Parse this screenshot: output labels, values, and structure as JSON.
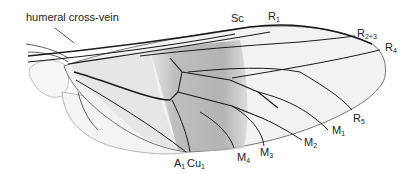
{
  "figure": {
    "labels": {
      "humeral": "humeral cross-vein",
      "sc": {
        "base": "Sc",
        "sub": ""
      },
      "r1": {
        "base": "R",
        "sub": "1"
      },
      "r23": {
        "base": "R",
        "sub": "2+3"
      },
      "r4": {
        "base": "R",
        "sub": "4"
      },
      "r5": {
        "base": "R",
        "sub": "5"
      },
      "m1": {
        "base": "M",
        "sub": "1"
      },
      "m2": {
        "base": "M",
        "sub": "2"
      },
      "m3": {
        "base": "M",
        "sub": "3"
      },
      "m4": {
        "base": "M",
        "sub": "4"
      },
      "a1": {
        "base": "A",
        "sub": "1"
      },
      "cu1": {
        "base": "Cu",
        "sub": "1"
      }
    },
    "colors": {
      "vein": "#1a1a1a",
      "membrane": "#f3f3f3",
      "shade": "#b9b9b9",
      "text": "#222222"
    }
  }
}
